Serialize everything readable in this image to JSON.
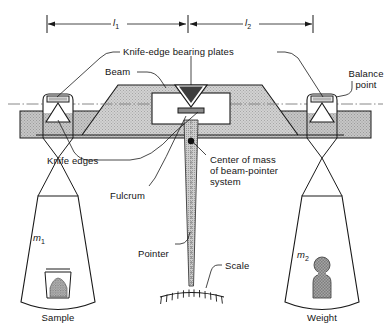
{
  "figure": {
    "colors": {
      "stroke": "#1a1a1a",
      "beam_fill": "#c9c9c9",
      "base_fill": "#bdbdbd",
      "weight_fill": "#9a9a9a",
      "sample_fill": "#a8a8a8",
      "centerline": "#6e6e6e",
      "background": "#ffffff"
    }
  },
  "dimensions": {
    "left_label": "l",
    "left_sub": "1",
    "right_label": "l",
    "right_sub": "2"
  },
  "labels": {
    "knife_edge_bearing_plates": "Knife-edge bearing plates",
    "beam": "Beam",
    "balance_point_line1": "Balance",
    "balance_point_line2": "point",
    "knife_edges": "Knife edges",
    "center_of_mass_line1": "Center of mass",
    "center_of_mass_line2": "of beam-pointer",
    "center_of_mass_line3": "system",
    "fulcrum": "Fulcrum",
    "pointer": "Pointer",
    "scale": "Scale",
    "sample": "Sample",
    "weight": "Weight",
    "mass_left": "m",
    "mass_left_sub": "1",
    "mass_right": "m",
    "mass_right_sub": "2"
  }
}
